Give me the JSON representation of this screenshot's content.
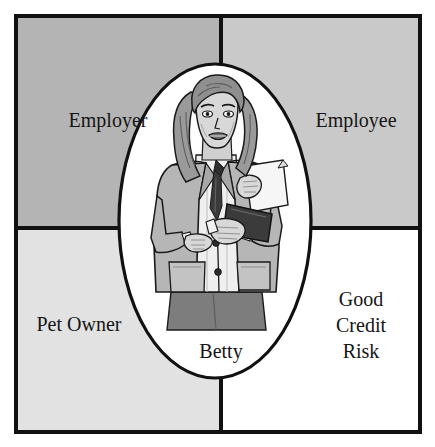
{
  "diagram": {
    "type": "venn-quadrant-role-diagram",
    "frame": {
      "border_color": "#111111",
      "background_color": "#ffffff"
    },
    "quadrants": [
      {
        "id": "employer",
        "label": "Employer",
        "position": "top-left",
        "fill_color": "#b4b4b4"
      },
      {
        "id": "employee",
        "label": "Employee",
        "position": "top-right",
        "fill_color": "#c9c9c9"
      },
      {
        "id": "pet-owner",
        "label": "Pet Owner",
        "position": "bottom-left",
        "fill_color": "#e2e2e2"
      },
      {
        "id": "good-credit-risk",
        "label_line1": "Good",
        "label_line2": "Credit",
        "label_line3": "Risk",
        "position": "bottom-right",
        "fill_color": "#ffffff"
      }
    ],
    "center": {
      "id": "betty",
      "label": "Betty",
      "shape": "ellipse",
      "fill_color": "#ffffff",
      "stroke_color": "#111111",
      "illustration": "businesswoman-holding-clipboard-illustration",
      "illustration_colors": {
        "skin": "#d8d8d8",
        "hair": "#9a9a9a",
        "jacket": "#b6b6b6",
        "jacket_shadow": "#949494",
        "blouse": "#f2f2f2",
        "skirt": "#7d7d7d",
        "clipboard": "#3b3b3b",
        "paper": "#f4f4f4",
        "outline": "#1a1a1a"
      }
    }
  }
}
